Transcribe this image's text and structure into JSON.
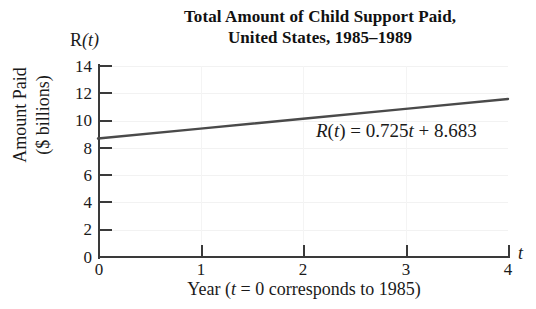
{
  "chart_data": {
    "type": "line",
    "title": "Total Amount of Child Support Paid, United States, 1985–1989",
    "title_lines": [
      "Total Amount of Child Support Paid,",
      "United States, 1985–1989"
    ],
    "xlabel": "Year (t = 0 corresponds to 1985)",
    "ylabel": "Amount Paid ($ billions)",
    "ylabel_lines": [
      "Amount Paid",
      "($ billions)"
    ],
    "x_axis_symbol": "t",
    "y_axis_symbol": "R(t)",
    "xlim": [
      0,
      4
    ],
    "ylim": [
      0,
      14
    ],
    "xticks": [
      0,
      1,
      2,
      3,
      4
    ],
    "yticks": [
      0,
      2,
      4,
      6,
      8,
      10,
      12,
      14
    ],
    "xtick_labels": [
      "0",
      "1",
      "2",
      "3",
      "4"
    ],
    "ytick_labels": [
      "0",
      "2",
      "4",
      "6",
      "8",
      "10",
      "12",
      "14"
    ],
    "grid": true,
    "legend": "none",
    "annotations": [
      {
        "text": "R(t) = 0.725t + 8.683",
        "parts": {
          "fn_name": "R",
          "var_open": "(",
          "var": "t",
          "var_close": ")",
          "equals": "=",
          "slope": "0.725",
          "slope_var": "t",
          "plus": "+",
          "intercept": "8.683"
        }
      }
    ],
    "equation": {
      "slope": 0.725,
      "intercept": 8.683,
      "formula": "R(t) = 0.725t + 8.683"
    },
    "series": [
      {
        "name": "R(t) = 0.725t + 8.683",
        "x": [
          0,
          1,
          2,
          3,
          4
        ],
        "values": [
          8.683,
          9.408,
          10.133,
          10.858,
          11.583
        ],
        "color": "#4a4a4a"
      }
    ]
  },
  "colors": {
    "line": "#4a4a4a",
    "axis": "#3a3a3a",
    "grid": "#f2f2f2",
    "text": "#1a1a1a",
    "background": "#ffffff"
  },
  "title": {
    "line1": "Total Amount of Child Support Paid,",
    "line2": "United States, 1985–1989"
  },
  "axes": {
    "y_symbol": "R(t)",
    "x_symbol": "t",
    "y_title_line1": "Amount Paid",
    "y_title_line2": "($ billions)",
    "x_caption_prefix": "Year (",
    "x_caption_var": "t",
    "x_caption_suffix": " = 0 corresponds to 1985)"
  },
  "equation_text": {
    "fn": "R",
    "paren_open": "(",
    "fn_var": "t",
    "paren_close": ")",
    "equals": " = ",
    "slope": "0.725",
    "slope_var": "t",
    "plus": " + ",
    "intercept": "8.683"
  }
}
